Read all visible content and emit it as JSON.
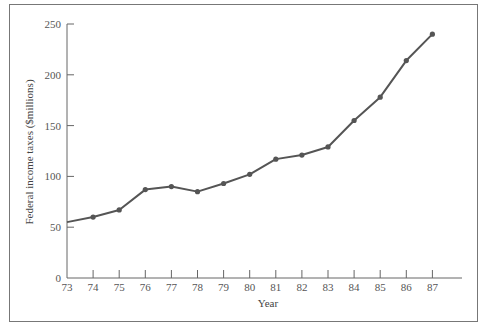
{
  "chart_data": {
    "type": "line",
    "title": "",
    "xlabel": "Year",
    "ylabel": "Federal income taxes ($millions)",
    "x": [
      "73",
      "74",
      "75",
      "76",
      "77",
      "78",
      "79",
      "80",
      "81",
      "82",
      "83",
      "84",
      "85",
      "86",
      "87"
    ],
    "series": [
      {
        "name": "Federal income taxes",
        "values": [
          55,
          60,
          67,
          87,
          90,
          85,
          93,
          102,
          117,
          121,
          129,
          155,
          178,
          214,
          240
        ],
        "markers": [
          false,
          true,
          true,
          true,
          true,
          true,
          true,
          true,
          true,
          true,
          true,
          true,
          true,
          true,
          true
        ]
      }
    ],
    "yticks": [
      0,
      50,
      100,
      150,
      200,
      250
    ],
    "xticks": [
      "73",
      "74",
      "75",
      "76",
      "77",
      "78",
      "79",
      "80",
      "81",
      "82",
      "83",
      "84",
      "85",
      "86",
      "87"
    ],
    "ylim": [
      0,
      250
    ],
    "xlim": [
      "73",
      "88.2"
    ],
    "grid": false,
    "legend": "none",
    "colors": {
      "line": "#555555",
      "axis": "#666666",
      "frame": "#777777",
      "text": "#555555"
    }
  }
}
